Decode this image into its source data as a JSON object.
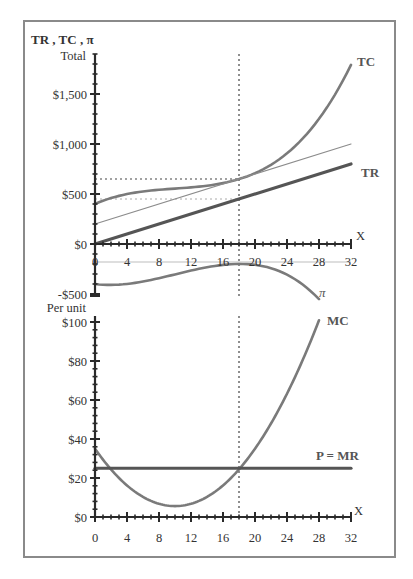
{
  "chart_data": [
    {
      "type": "line",
      "panel": "top",
      "title": "",
      "ylabel": "TR , TC , π",
      "ylabel_sub": "Total",
      "xlabel": "X",
      "xlim": [
        0,
        32
      ],
      "ylim": [
        -500,
        1900
      ],
      "x_ticks": [
        0,
        4,
        8,
        12,
        16,
        20,
        24,
        28,
        32
      ],
      "y_ticks": [
        {
          "value": 1500,
          "label": "$1,500"
        },
        {
          "value": 1000,
          "label": "$1,000"
        },
        {
          "value": 500,
          "label": "$500"
        },
        {
          "value": 0,
          "label": "$0"
        },
        {
          "value": -500,
          "label": "-$500"
        }
      ],
      "grid": false,
      "series": [
        {
          "name": "TC",
          "label": "TC",
          "style": "thick-gray",
          "x": [
            0,
            2,
            4,
            6,
            8,
            10,
            12,
            14,
            16,
            18,
            20,
            22,
            24,
            26,
            28,
            30,
            32
          ],
          "values": [
            400,
            454,
            497,
            531,
            559,
            584,
            606,
            629,
            657,
            650,
            700,
            770,
            880,
            1030,
            1226,
            1480,
            1790
          ]
        },
        {
          "name": "TR",
          "label": "TR",
          "style": "thick-dark",
          "x": [
            0,
            32
          ],
          "values": [
            0,
            800
          ]
        },
        {
          "name": "Iso-profit line (TR + 200)",
          "label": "",
          "style": "thin-gray",
          "x": [
            0,
            32
          ],
          "values": [
            200,
            1000
          ]
        },
        {
          "name": "π",
          "label": "π",
          "style": "thick-gray",
          "x": [
            0,
            2,
            4,
            6,
            8,
            10,
            12,
            14,
            16,
            18,
            20,
            22,
            24,
            26,
            28
          ],
          "values": [
            -400,
            -404,
            -397,
            -381,
            -359,
            -334,
            -306,
            -279,
            -257,
            -200,
            -200,
            -220,
            -280,
            -380,
            -526
          ]
        }
      ],
      "annotations": [
        {
          "type": "vline",
          "x": 18,
          "style": "dotted"
        },
        {
          "type": "hline",
          "y": 650,
          "x_to": 18,
          "style": "dotted"
        },
        {
          "type": "hline",
          "y": 450,
          "x_to": 18,
          "style": "dotted-light"
        }
      ],
      "price": 25,
      "profit_max_quantity": 18
    },
    {
      "type": "line",
      "panel": "bottom",
      "title": "",
      "ylabel": "Per unit",
      "xlabel": "X",
      "xlim": [
        0,
        32
      ],
      "ylim": [
        0,
        100
      ],
      "x_ticks": [
        0,
        4,
        8,
        12,
        16,
        20,
        24,
        28,
        32
      ],
      "y_ticks": [
        {
          "value": 100,
          "label": "$100"
        },
        {
          "value": 80,
          "label": "$80"
        },
        {
          "value": 60,
          "label": "$60"
        },
        {
          "value": 40,
          "label": "$40"
        },
        {
          "value": 20,
          "label": "$20"
        },
        {
          "value": 0,
          "label": "$0"
        }
      ],
      "grid": false,
      "series": [
        {
          "name": "MC",
          "label": "MC",
          "style": "thick-gray",
          "x": [
            0,
            2,
            4,
            6,
            8,
            10,
            12,
            14,
            16,
            18,
            20,
            22,
            24,
            26,
            28
          ],
          "values": [
            35,
            24.4,
            16.2,
            10.3,
            6.8,
            5.6,
            6.8,
            10.3,
            16.2,
            24.4,
            35,
            48,
            63.2,
            80.9,
            100.9
          ]
        },
        {
          "name": "P = MR",
          "label": "P = MR",
          "style": "thick-dark",
          "x": [
            0,
            32
          ],
          "values": [
            25,
            25
          ]
        }
      ],
      "annotations": [
        {
          "type": "vline",
          "x": 18,
          "style": "dotted"
        }
      ]
    }
  ],
  "layout": {
    "frame": {
      "left": 24,
      "top": 21,
      "right": 395,
      "bottom": 557
    },
    "top": {
      "x0": 95,
      "px_per_x": 8,
      "y_zero": 244,
      "px_per_y": 0.1,
      "axis_top": 54,
      "axis_bottom": 296,
      "x_label_y": 262
    },
    "bottom": {
      "x0": 95,
      "px_per_x": 8,
      "y_zero": 517,
      "px_per_y": 1.95,
      "axis_top": 316,
      "x_label_y": 538
    }
  },
  "colors": {
    "curve_gray": "#7a7a7a",
    "curve_dark": "#555555",
    "thin_line": "#8c8c8c",
    "axis": "#2a2a2a",
    "frame": "#8a8a8a"
  },
  "labels": {
    "top_ylabel": "TR , TC , π",
    "top_ylabel_sub": "Total",
    "bottom_ylabel": "Per unit",
    "x_axis_name": "X",
    "tc": "TC",
    "tr": "TR",
    "pi": "π",
    "mc": "MC",
    "p_mr": "P = MR"
  }
}
